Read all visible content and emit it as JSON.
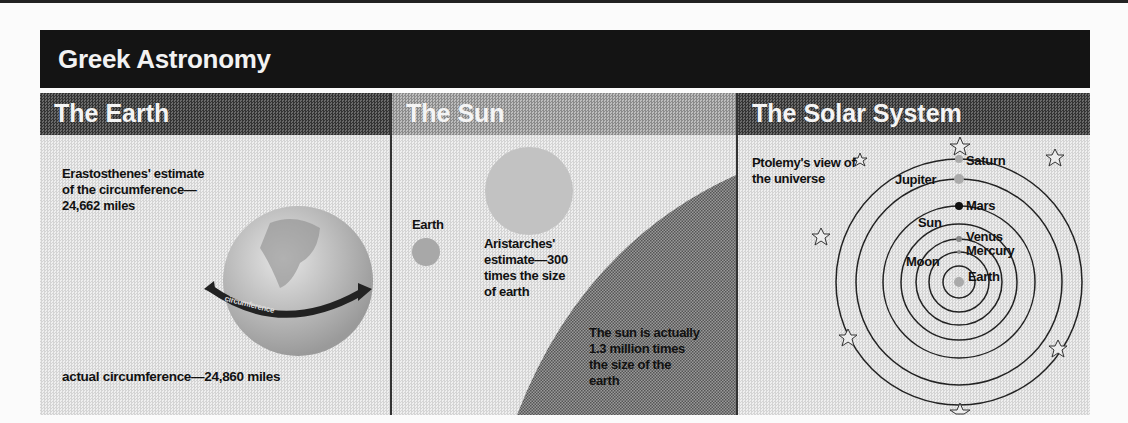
{
  "title": "Greek Astronomy",
  "panels": {
    "earth": {
      "header": "The Earth",
      "estimate_line1": "Erastosthenes' estimate",
      "estimate_line2": "of the circumference—",
      "estimate_line3": "24,662 miles",
      "arrow_label": "circumference",
      "actual": "actual circumference—24,860 miles"
    },
    "sun": {
      "header": "The Sun",
      "earth_label": "Earth",
      "estimate_line1": "Aristarches'",
      "estimate_line2": "estimate—300",
      "estimate_line3": "times the size",
      "estimate_line4": "of earth",
      "actual_line1": "The sun is actually",
      "actual_line2": "1.3 million times",
      "actual_line3": "the size of the",
      "actual_line4": "earth"
    },
    "solar_system": {
      "header": "The Solar System",
      "caption_line1": "Ptolemy's view of",
      "caption_line2": "the universe",
      "bodies": [
        "Saturn",
        "Jupiter",
        "Mars",
        "Sun",
        "Venus",
        "Mercury",
        "Moon",
        "Earth"
      ]
    }
  }
}
